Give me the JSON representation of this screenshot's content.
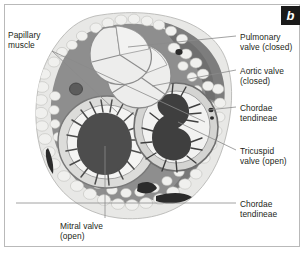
{
  "figure": {
    "panel_label": "b"
  },
  "labels": [
    {
      "id": "papillary-muscle",
      "text": "Papillary\nmuscle",
      "x": 8,
      "y": 30,
      "align": "left"
    },
    {
      "id": "pulmonary-valve",
      "text": "Pulmonary\nvalve (closed)",
      "x": 240,
      "y": 32,
      "align": "left"
    },
    {
      "id": "aortic-valve",
      "text": "Aortic valve\n(closed)",
      "x": 240,
      "y": 66,
      "align": "left"
    },
    {
      "id": "chordae-tendineae-upper",
      "text": "Chordae\ntendineae",
      "x": 240,
      "y": 103,
      "align": "left"
    },
    {
      "id": "tricuspid-valve",
      "text": "Tricuspid\nvalve (open)",
      "x": 240,
      "y": 146,
      "align": "left"
    },
    {
      "id": "chordae-tendineae-lower",
      "text": "Chordae\ntendineae",
      "x": 240,
      "y": 199,
      "align": "left"
    },
    {
      "id": "mitral-valve",
      "text": "Mitral valve\n(open)",
      "x": 60,
      "y": 221,
      "align": "left"
    }
  ],
  "colors": {
    "background": "#ffffff",
    "frame_border": "#b9b9b9",
    "label_text": "#231f20",
    "leader_line": "#8a8a8a",
    "badge_background": "#1a1a1a",
    "badge_text": "#ffffff",
    "myocardium": "#8e8e8e",
    "myocardium_dark": "#6f6f6f",
    "epicardial_fat": "#e8e8e6",
    "fat_outline": "#b5b5b2",
    "valve_leaflet": "#ececeb",
    "valve_outline": "#8c8c8c",
    "chamber_lumen": "#f2f2f1",
    "chordae_dark": "#4a4a4a",
    "vessel_black": "#2b2b2b"
  },
  "anatomy": {
    "structures": [
      "pulmonary valve (closed, three cusps)",
      "aortic valve (closed, three cusps)",
      "mitral valve (open, left ventricular chamber)",
      "tricuspid valve (open, right ventricular chamber)",
      "chordae tendineae",
      "papillary muscle",
      "epicardial fat",
      "coronary vessels"
    ]
  }
}
